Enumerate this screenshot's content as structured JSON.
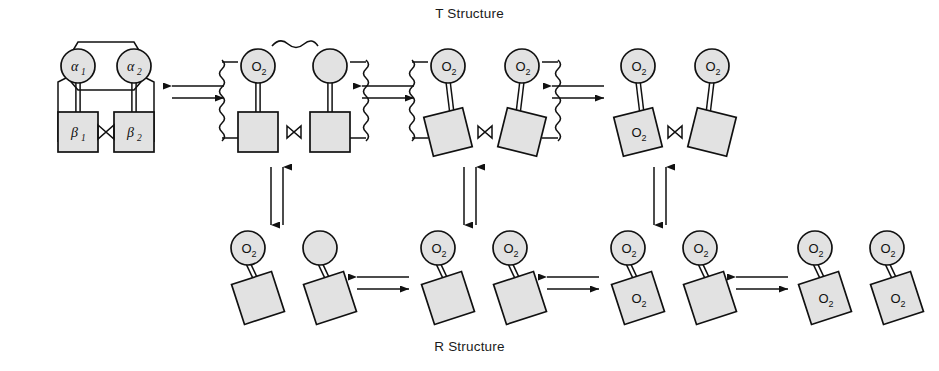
{
  "diagram": {
    "title_top": "T Structure",
    "title_bottom": "R Structure",
    "colors": {
      "subunit_fill": "#e2e2e2",
      "stroke": "#111111",
      "background": "#ffffff"
    },
    "o2_label": "O",
    "o2_subscript": "2",
    "alpha_symbol": "α",
    "beta_symbol": "β",
    "subunit_labels": {
      "alpha1_base": "α",
      "alpha1_sub": "1",
      "alpha2_base": "α",
      "alpha2_sub": "2",
      "beta1_base": "β",
      "beta1_sub": "1",
      "beta2_base": "β",
      "beta2_sub": "2"
    },
    "t_row": {
      "name": "T Structure row",
      "states": [
        {
          "id": "t0",
          "oxygens_bound": 0,
          "description": "Deoxyhemoglobin, tense state, alpha1 alpha2 beta1 beta2 constrained",
          "alpha_labeled": true,
          "beta_labeled": true,
          "constraint_style": "straight-bracket",
          "o2_on_circles": [],
          "o2_on_squares": []
        },
        {
          "id": "t1",
          "oxygens_bound": 1,
          "description": "One O2 bound to left alpha subunit, strain shown by wavy lines",
          "alpha_labeled": false,
          "beta_labeled": false,
          "constraint_style": "wavy",
          "o2_on_circles": [
            "left"
          ],
          "o2_on_squares": []
        },
        {
          "id": "t2",
          "oxygens_bound": 2,
          "description": "Two O2 bound to both alpha subunits, increased strain",
          "alpha_labeled": false,
          "beta_labeled": false,
          "constraint_style": "wavy",
          "o2_on_circles": [
            "left",
            "right"
          ],
          "o2_on_squares": []
        },
        {
          "id": "t3",
          "oxygens_bound": 3,
          "description": "Three O2 bound, two alpha and one beta subunit, constraints broken",
          "alpha_labeled": false,
          "beta_labeled": false,
          "constraint_style": "none",
          "o2_on_circles": [
            "left",
            "right"
          ],
          "o2_on_squares": [
            "left"
          ]
        }
      ]
    },
    "r_row": {
      "name": "R Structure row",
      "states": [
        {
          "id": "r1",
          "oxygens_bound": 1,
          "description": "Relaxed state with one O2 bound to left alpha subunit",
          "o2_on_circles": [
            "left"
          ],
          "o2_on_squares": []
        },
        {
          "id": "r2",
          "oxygens_bound": 2,
          "description": "Relaxed state with two O2 bound to both alpha subunits",
          "o2_on_circles": [
            "left",
            "right"
          ],
          "o2_on_squares": []
        },
        {
          "id": "r3",
          "oxygens_bound": 3,
          "description": "Relaxed state with three O2 bound",
          "o2_on_circles": [
            "left",
            "right"
          ],
          "o2_on_squares": [
            "left"
          ]
        },
        {
          "id": "r4",
          "oxygens_bound": 4,
          "description": "Fully oxygenated relaxed state with four O2 bound",
          "o2_on_circles": [
            "left",
            "right"
          ],
          "o2_on_squares": [
            "left",
            "right"
          ]
        }
      ]
    },
    "horizontal_equilibria": {
      "count_top": 3,
      "count_bottom": 3,
      "style": "double-arrow-equilibrium",
      "top_arrow_direction": "left",
      "bottom_arrow_direction": "right"
    },
    "vertical_equilibria": {
      "count": 3,
      "style": "double-arrow-equilibrium",
      "left_arrow_direction": "down",
      "right_arrow_direction": "up"
    }
  }
}
